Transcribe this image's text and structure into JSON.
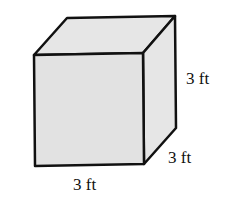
{
  "figure": {
    "shape": "cube",
    "colors": {
      "face_fill": "#e4e4e4",
      "edge": "#111111",
      "background": "#ffffff"
    },
    "labels": {
      "height": "3 ft",
      "depth": "3 ft",
      "width": "3 ft"
    }
  }
}
